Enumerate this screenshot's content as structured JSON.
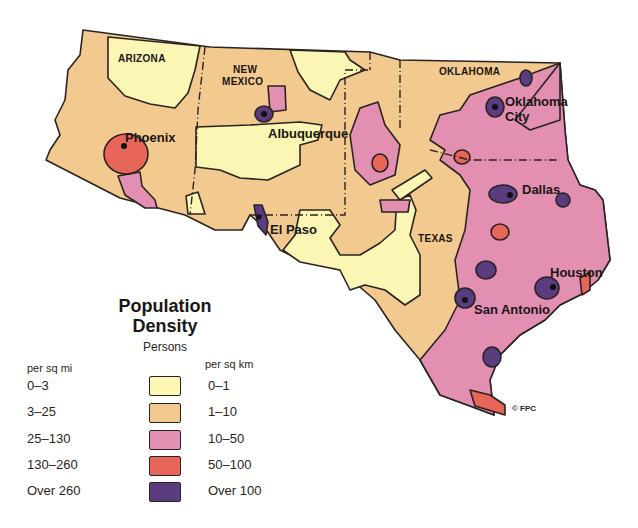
{
  "map": {
    "title": "Population Density",
    "title_line1": "Population",
    "title_line2": "Density",
    "subtitle": "Persons",
    "states": [
      "ARIZONA",
      "NEW MEXICO",
      "OKLAHOMA",
      "TEXAS"
    ],
    "state_labels": {
      "arizona": "ARIZONA",
      "new_mexico_1": "NEW",
      "new_mexico_2": "MEXICO",
      "oklahoma": "OKLAHOMA",
      "texas": "TEXAS"
    },
    "cities": {
      "phoenix": "Phoenix",
      "albuquerque": "Albuquerque",
      "el_paso": "El Paso",
      "oklahoma_city_1": "Oklahoma",
      "oklahoma_city_2": "City",
      "dallas": "Dallas",
      "houston": "Houston",
      "san_antonio": "San Antonio"
    },
    "copyright": "© FPC"
  },
  "legend": {
    "col_mi": "per sq mi",
    "col_km": "per sq km",
    "classes": [
      {
        "per_sq_mi": "0–3",
        "per_sq_km": "0–1",
        "color": "#fbf6b4"
      },
      {
        "per_sq_mi": "3–25",
        "per_sq_km": "1–10",
        "color": "#f2c98f"
      },
      {
        "per_sq_mi": "25–130",
        "per_sq_km": "10–50",
        "color": "#e28fb2"
      },
      {
        "per_sq_mi": "130–260",
        "per_sq_km": "50–100",
        "color": "#e8655a"
      },
      {
        "per_sq_mi": "Over 260",
        "per_sq_km": "Over 100",
        "color": "#5b3c80"
      }
    ]
  }
}
